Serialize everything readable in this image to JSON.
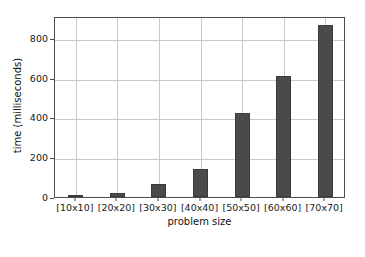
{
  "figure": {
    "background_color": "#ffffff",
    "axes_color": "#4d4d4d",
    "grid_color": "#c9c9c9",
    "bar_color": "#4a4a4a"
  },
  "chart_data": {
    "type": "bar",
    "title": "",
    "xlabel": "problem size",
    "ylabel": "time (milliseconds)",
    "categories": [
      "[10x10]",
      "[20x20]",
      "[30x30]",
      "[40x40]",
      "[50x50]",
      "[60x60]",
      "[70x70]"
    ],
    "values": [
      3,
      20,
      65,
      140,
      420,
      610,
      865
    ],
    "ylim": [
      0,
      910
    ],
    "xlim": [
      0,
      7
    ],
    "yticks": [
      0,
      200,
      400,
      600,
      800
    ],
    "ytick_labels": [
      "0",
      "200",
      "400",
      "600",
      "800"
    ],
    "xtick_labels": [
      "[10x10]",
      "[20x20]",
      "[30x30]",
      "[40x40]",
      "[50x50]",
      "[60x60]",
      "[70x70]"
    ],
    "grid": true,
    "legend": null,
    "legend_position": "none",
    "series": [
      {
        "name": "time",
        "values": [
          3,
          20,
          65,
          140,
          420,
          610,
          865
        ]
      }
    ]
  }
}
